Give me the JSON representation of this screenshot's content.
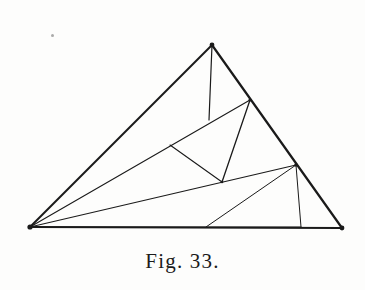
{
  "figure": {
    "caption": "Fig. 33.",
    "title": "Fig. 33.",
    "ink_color": "#1a1a1a",
    "paper_color": "#fdfdfc",
    "speck_color": "#8d8d8d",
    "canvas": {
      "width": 365,
      "height": 290
    },
    "points": {
      "A": {
        "name": "apex-vertex",
        "x": 212,
        "y": 45
      },
      "B": {
        "name": "bottom-left-vertex",
        "x": 30,
        "y": 227
      },
      "C": {
        "name": "bottom-right-vertex",
        "x": 342,
        "y": 228
      },
      "D": {
        "name": "upper-right-edge-node",
        "x": 250,
        "y": 100
      },
      "E": {
        "name": "lower-right-edge-node",
        "x": 296,
        "y": 165
      },
      "F": {
        "name": "center-left-node",
        "x": 170,
        "y": 145
      },
      "G": {
        "name": "center-node",
        "x": 222,
        "y": 182
      },
      "H": {
        "name": "base-node-left",
        "x": 206,
        "y": 227
      },
      "I": {
        "name": "base-node-right",
        "x": 301,
        "y": 227
      },
      "J": {
        "name": "apex-stub-end",
        "x": 209,
        "y": 120
      }
    },
    "edges": [
      {
        "name": "triangle-side-left",
        "from": "A",
        "to": "B",
        "weight": 2.0
      },
      {
        "name": "triangle-side-right",
        "from": "A",
        "to": "C",
        "weight": 2.2
      },
      {
        "name": "triangle-base",
        "from": "B",
        "to": "C",
        "weight": 2.0
      },
      {
        "name": "cevian-apex-stub",
        "from": "A",
        "to": "J",
        "weight": 1.2
      },
      {
        "name": "cevian-b-to-d",
        "from": "B",
        "to": "D",
        "weight": 1.1
      },
      {
        "name": "cevian-b-to-e",
        "from": "B",
        "to": "E",
        "weight": 1.1
      },
      {
        "name": "cevian-b-to-i",
        "from": "B",
        "to": "I",
        "weight": 1.0
      },
      {
        "name": "segment-f-to-g",
        "from": "F",
        "to": "G",
        "weight": 1.1
      },
      {
        "name": "segment-d-to-g",
        "from": "D",
        "to": "G",
        "weight": 1.3
      },
      {
        "name": "segment-e-to-h",
        "from": "E",
        "to": "H",
        "weight": 1.0
      },
      {
        "name": "segment-e-to-i",
        "from": "E",
        "to": "I",
        "weight": 1.0
      }
    ],
    "speck": {
      "name": "scan-artifact-speck",
      "x": 51,
      "y": 34
    }
  },
  "chart_data": {
    "type": "diagram",
    "title": "Fig. 33.",
    "vertices": [
      {
        "label": "A",
        "x": 212,
        "y": 45
      },
      {
        "label": "B",
        "x": 30,
        "y": 227
      },
      {
        "label": "C",
        "x": 342,
        "y": 228
      },
      {
        "label": "D",
        "x": 250,
        "y": 100
      },
      {
        "label": "E",
        "x": 296,
        "y": 165
      },
      {
        "label": "F",
        "x": 170,
        "y": 145
      },
      {
        "label": "G",
        "x": 222,
        "y": 182
      },
      {
        "label": "H",
        "x": 206,
        "y": 227
      },
      {
        "label": "I",
        "x": 301,
        "y": 227
      },
      {
        "label": "J",
        "x": 209,
        "y": 120
      }
    ],
    "segments": [
      [
        "A",
        "B"
      ],
      [
        "A",
        "C"
      ],
      [
        "B",
        "C"
      ],
      [
        "A",
        "J"
      ],
      [
        "B",
        "D"
      ],
      [
        "B",
        "E"
      ],
      [
        "B",
        "I"
      ],
      [
        "F",
        "G"
      ],
      [
        "D",
        "G"
      ],
      [
        "E",
        "H"
      ],
      [
        "E",
        "I"
      ]
    ]
  }
}
